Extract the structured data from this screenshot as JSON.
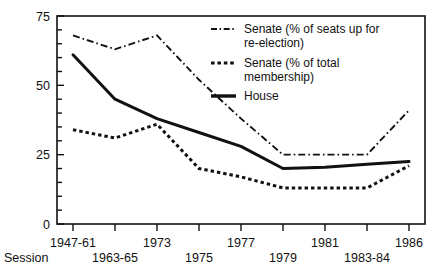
{
  "chart_data": {
    "type": "line",
    "title": "",
    "xlabel": "Session",
    "ylabel": "",
    "ylim": [
      0,
      75
    ],
    "yticks": [
      0,
      25,
      50,
      75
    ],
    "ytick_labels": [
      "0",
      "25",
      "50",
      "75"
    ],
    "yminor_step": 5,
    "grid": false,
    "legend_position": "top-right inside plot",
    "categories": [
      "1947-61",
      "1963-65",
      "1973",
      "1975",
      "1977",
      "1979",
      "1981",
      "1983-84",
      "1986"
    ],
    "series": [
      {
        "name": "Senate (% of seats up for re-election)",
        "style": "dash-dot",
        "values": [
          68,
          63,
          68,
          52,
          38,
          25,
          25,
          25,
          41
        ]
      },
      {
        "name": "Senate (% of total membership)",
        "style": "dotted",
        "values": [
          34,
          31,
          36,
          20,
          17,
          13,
          13,
          13,
          21
        ]
      },
      {
        "name": "House",
        "style": "solid",
        "values": [
          61,
          45,
          38,
          33,
          28,
          20,
          20.5,
          21.5,
          22.5
        ]
      }
    ]
  },
  "axes": {
    "y_tick_labels": [
      "75",
      "50",
      "25",
      "0"
    ],
    "x_tick_labels_top": [
      "1947-61",
      "1973",
      "1977",
      "1981",
      "1986"
    ],
    "x_tick_labels_bottom": [
      "1963-65",
      "1975",
      "1979",
      "1983-84"
    ],
    "session_label": "Session"
  },
  "legend": {
    "entries": [
      {
        "label_line1": "Senate (% of seats up for",
        "label_line2": "re-election)",
        "swatch": "dash-dot-swatch"
      },
      {
        "label_line1": "Senate (% of total",
        "label_line2": "membership)",
        "swatch": "dotted-swatch"
      },
      {
        "label_line1": "House",
        "label_line2": "",
        "swatch": "solid-swatch"
      }
    ]
  },
  "colors": {
    "ink": "#111111",
    "background": "#ffffff"
  }
}
